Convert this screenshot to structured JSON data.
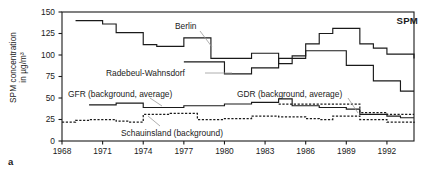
{
  "figure": {
    "panel_label": "a",
    "corner_label": "SPM",
    "ylabel_line1": "SPM concentration",
    "ylabel_line2": "in µg/m³"
  },
  "axes": {
    "y_ticks": [
      0,
      25,
      50,
      75,
      100,
      125,
      150
    ],
    "x_ticks": [
      1968,
      1971,
      1974,
      1977,
      1980,
      1983,
      1986,
      1989,
      1992
    ],
    "xlim": [
      1968,
      1994
    ],
    "ylim": [
      0,
      150
    ],
    "grid": false
  },
  "annotations": [
    {
      "name": "berlin",
      "text": "Berlin"
    },
    {
      "name": "radebeul-wahnsdorf",
      "text": "Radebeul-Wahnsdorf"
    },
    {
      "name": "gfr-background",
      "text": "GFR (background, average)"
    },
    {
      "name": "gdr-background",
      "text": "GDR (background, average)"
    },
    {
      "name": "schauinsland-background",
      "text": "Schauinsland (background)"
    }
  ],
  "colors": {
    "line": "#1a1a1a",
    "frame": "#1a1a1a",
    "background": "#ffffff"
  },
  "chart_data": {
    "type": "line",
    "title": "SPM",
    "xlabel": "",
    "ylabel": "SPM concentration in µg/m³",
    "xlim": [
      1968,
      1994
    ],
    "ylim": [
      0,
      150
    ],
    "x_ticks": [
      1968,
      1971,
      1974,
      1977,
      1980,
      1983,
      1986,
      1989,
      1992
    ],
    "y_ticks": [
      0,
      25,
      50,
      75,
      100,
      125,
      150
    ],
    "grid": false,
    "legend": "inline annotations",
    "step_style": "post",
    "series": [
      {
        "name": "Berlin",
        "style": "solid",
        "x": [
          1969,
          1970,
          1971,
          1972,
          1973,
          1974,
          1975,
          1976,
          1977,
          1978,
          1979,
          1980,
          1981,
          1982,
          1983,
          1984,
          1985,
          1986,
          1987,
          1988,
          1989,
          1990,
          1991,
          1992,
          1993,
          1994
        ],
        "values": [
          140,
          140,
          136,
          126,
          126,
          112,
          110,
          110,
          120,
          120,
          96,
          96,
          96,
          102,
          102,
          90,
          99,
          113,
          125,
          131,
          131,
          113,
          108,
          101,
          101,
          96
        ]
      },
      {
        "name": "Radebeul-Wahnsdorf",
        "style": "solid",
        "x": [
          1977,
          1978,
          1979,
          1980,
          1981,
          1982,
          1983,
          1984,
          1985,
          1986,
          1987,
          1988,
          1989,
          1990,
          1991,
          1992,
          1993,
          1994
        ],
        "values": [
          92,
          92,
          92,
          78,
          78,
          85,
          85,
          96,
          96,
          105,
          105,
          105,
          88,
          88,
          70,
          70,
          58,
          58
        ]
      },
      {
        "name": "GFR (background, average)",
        "style": "solid",
        "x": [
          1970,
          1971,
          1972,
          1973,
          1974,
          1975,
          1976,
          1977,
          1978,
          1979,
          1980,
          1981,
          1982,
          1983,
          1984,
          1985,
          1986,
          1987,
          1988,
          1989,
          1990,
          1991,
          1992,
          1993,
          1994
        ],
        "values": [
          42,
          42,
          44,
          44,
          39,
          39,
          39,
          41,
          41,
          41,
          43,
          43,
          45,
          45,
          49,
          41,
          41,
          39,
          39,
          37,
          31,
          31,
          29,
          27,
          27
        ]
      },
      {
        "name": "GDR (background, average)",
        "style": "dashed",
        "x": [
          1984,
          1985,
          1986,
          1987,
          1988,
          1989,
          1990,
          1991,
          1992,
          1993,
          1994
        ],
        "values": [
          43,
          43,
          43,
          43,
          43,
          43,
          33,
          33,
          31,
          31,
          31
        ]
      },
      {
        "name": "Schauinsland (background)",
        "style": "dashed",
        "x": [
          1968,
          1969,
          1970,
          1971,
          1972,
          1973,
          1974,
          1975,
          1976,
          1977,
          1978,
          1979,
          1980,
          1981,
          1982,
          1983,
          1984,
          1985,
          1986,
          1987,
          1988,
          1989,
          1990,
          1991,
          1992,
          1993,
          1994
        ],
        "values": [
          22,
          24,
          25,
          25,
          23,
          22,
          31,
          31,
          32,
          32,
          25,
          25,
          26,
          26,
          29,
          29,
          28,
          28,
          26,
          25,
          29,
          29,
          25,
          25,
          22,
          22,
          21
        ]
      }
    ]
  }
}
